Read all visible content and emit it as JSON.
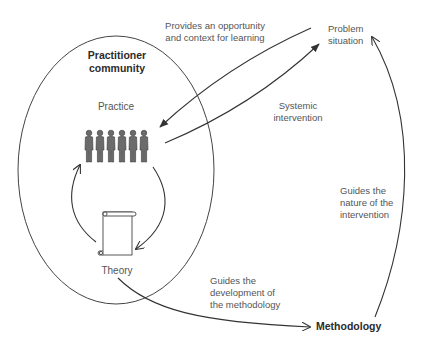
{
  "diagram": {
    "nodes": {
      "practitioner_community": {
        "lines": [
          "Practitioner",
          "community"
        ]
      },
      "practice": {
        "label": "Practice"
      },
      "theory": {
        "label": "Theory"
      },
      "problem_situation": {
        "lines": [
          "Problem",
          "situation"
        ]
      },
      "methodology": {
        "label": "Methodology"
      }
    },
    "edges": {
      "provides_opportunity": {
        "lines": [
          "Provides an opportunity",
          "and context for learning"
        ],
        "from": "Problem situation",
        "to": "Practice"
      },
      "systemic_intervention": {
        "lines": [
          "Systemic",
          "intervention"
        ],
        "from": "Practice",
        "to": "Problem situation"
      },
      "guides_nature": {
        "lines": [
          "Guides the",
          "nature of the",
          "intervention"
        ],
        "from": "Methodology",
        "to": "Problem situation"
      },
      "guides_development": {
        "lines": [
          "Guides the",
          "development of",
          "the methodology"
        ],
        "from": "Theory",
        "to": "Methodology"
      },
      "practice_to_theory": {
        "from": "Practice",
        "to": "Theory"
      },
      "theory_to_practice": {
        "from": "Theory",
        "to": "Practice"
      }
    },
    "icons": {
      "people_count": 6,
      "people_color": "#6b6b6b",
      "scroll": "scroll-icon"
    },
    "colors": {
      "line": "#333333",
      "text": "#555555",
      "bold_text": "#2b2b2b"
    }
  }
}
